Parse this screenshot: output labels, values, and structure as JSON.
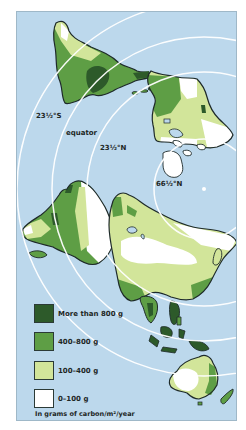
{
  "map": {
    "title": "",
    "projection": "polar (north pole centered)",
    "colors": {
      "ocean": "#bcd8ec",
      "outline": "#1e2a2a",
      "latitude_lines": "#ffffff"
    },
    "latitude_labels": [
      {
        "text": "23½°S",
        "id": "lat-23s"
      },
      {
        "text": "equator",
        "id": "lat-equator"
      },
      {
        "text": "23½°N",
        "id": "lat-23n"
      },
      {
        "text": "66½°N",
        "id": "lat-66n"
      }
    ],
    "legend": {
      "items": [
        {
          "label": "More than 800 g",
          "color": "#2d5a2a"
        },
        {
          "label": "400–800 g",
          "color": "#5e9e45"
        },
        {
          "label": "100–400 g",
          "color": "#d2e59a"
        },
        {
          "label": "0–100 g",
          "color": "#ffffff"
        }
      ],
      "units": "In grams of carbon/m²/year"
    }
  }
}
